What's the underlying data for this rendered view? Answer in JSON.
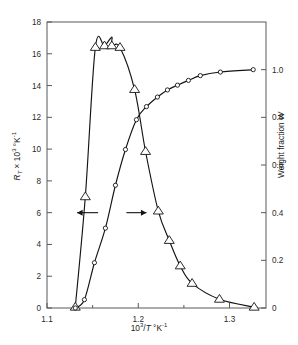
{
  "chart_data": {
    "type": "line",
    "title": "",
    "subtitle": "",
    "xlabel": "10³/T °K⁻¹",
    "xlabel_parts": {
      "base": "10",
      "exp": "3",
      "slash": "/",
      "var": "T",
      "unit_deg": " °K",
      "unit_exp": "-1"
    },
    "ylabel_left": "R_T × 10³ °K⁻¹",
    "ylabel_left_parts": {
      "var": "R",
      "sub": "T",
      "times": " × 10",
      "exp": "3",
      "unit_deg": " °K",
      "unit_exp": "-1"
    },
    "ylabel_right": "Weight fraction W",
    "ylabel_right_parts": {
      "text": "Weight fraction ",
      "var": "W"
    },
    "xlim": [
      1.1,
      1.34
    ],
    "ylim_left": [
      0,
      18
    ],
    "ylim_right": [
      0,
      1.2
    ],
    "xticks": [
      1.1,
      1.2,
      1.3
    ],
    "xtick_labels": [
      "1.1",
      "1.2",
      "1.3"
    ],
    "xminor_ticks": [
      1.15,
      1.25
    ],
    "yticks_left": [
      0,
      2,
      4,
      6,
      8,
      10,
      12,
      14,
      16,
      18
    ],
    "ytick_labels_left": [
      "0",
      "2",
      "4",
      "6",
      "8",
      "10",
      "12",
      "14",
      "16",
      "18"
    ],
    "yticks_right": [
      0,
      0.2,
      0.4,
      0.6,
      0.8,
      1.0
    ],
    "ytick_labels_right": [
      "0",
      "0.2",
      "0.4",
      "0.6",
      "0.8",
      "1.0"
    ],
    "grid": false,
    "legend": "none",
    "frame": "box",
    "series": [
      {
        "name": "R_T",
        "axis": "left",
        "marker": "triangle",
        "marker_size": 5.0,
        "x": [
          1.131,
          1.142,
          1.153,
          1.163,
          1.171,
          1.18,
          1.196,
          1.208,
          1.222,
          1.234,
          1.246,
          1.259,
          1.289,
          1.327
        ],
        "y": [
          0.05,
          7.0,
          16.4,
          16.5,
          16.5,
          16.4,
          13.75,
          9.85,
          6.1,
          4.25,
          2.65,
          1.55,
          0.55,
          0.05
        ],
        "peak": {
          "x": 1.171,
          "y": 17.05
        }
      },
      {
        "name": "W",
        "axis": "right",
        "marker": "circle",
        "marker_size": 4.2,
        "x": [
          1.131,
          1.141,
          1.152,
          1.164,
          1.175,
          1.186,
          1.198,
          1.209,
          1.221,
          1.232,
          1.243,
          1.255,
          1.268,
          1.29,
          1.326
        ],
        "y": [
          0.0,
          0.035,
          0.19,
          0.335,
          0.515,
          0.665,
          0.79,
          0.845,
          0.885,
          0.915,
          0.935,
          0.955,
          0.975,
          0.99,
          1.0
        ]
      }
    ],
    "annotations": [
      {
        "name": "left-axis-arrow",
        "type": "arrow",
        "direction": "left",
        "x_from": 1.156,
        "x_to": 1.133,
        "y_left": 6.0,
        "label": ""
      },
      {
        "name": "right-axis-arrow",
        "type": "arrow",
        "direction": "right",
        "x_from": 1.187,
        "x_to": 1.209,
        "y_left": 6.0,
        "label": ""
      }
    ]
  }
}
